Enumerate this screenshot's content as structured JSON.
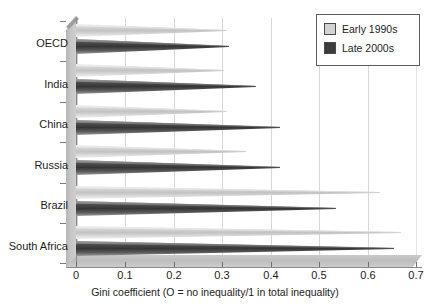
{
  "chart_data": {
    "type": "bar",
    "orientation": "horizontal",
    "style": "3d-cone",
    "title": "",
    "xlabel": "Gini coefficient (O = no inequality/1 in total inequality)",
    "ylabel": "",
    "xlim": [
      0,
      0.7
    ],
    "xticks": [
      "0",
      "0.1",
      "0.2",
      "0.3",
      "0.4",
      "0.5",
      "0.6",
      "0.7"
    ],
    "xtick_values": [
      0,
      0.1,
      0.2,
      0.3,
      0.4,
      0.5,
      0.6,
      0.7
    ],
    "grid": true,
    "grid_axis": "x",
    "legend_position": "top-right",
    "categories": [
      "OECD",
      "India",
      "China",
      "Russia",
      "Brazil",
      "South Africa"
    ],
    "series": [
      {
        "name": "Early 1990s",
        "color": "#d2d2d2",
        "values": [
          0.31,
          0.305,
          0.31,
          0.35,
          0.625,
          0.67
        ]
      },
      {
        "name": "Late 2000s",
        "color": "#3c3c3c",
        "values": [
          0.315,
          0.37,
          0.42,
          0.42,
          0.535,
          0.655
        ]
      }
    ]
  },
  "legend": {
    "items": [
      {
        "label": "Early 1990s",
        "color": "#d2d2d2"
      },
      {
        "label": "Late 2000s",
        "color": "#3c3c3c"
      }
    ]
  },
  "axis": {
    "x_title": "Gini coefficient (O = no inequality/1 in total inequality)"
  }
}
